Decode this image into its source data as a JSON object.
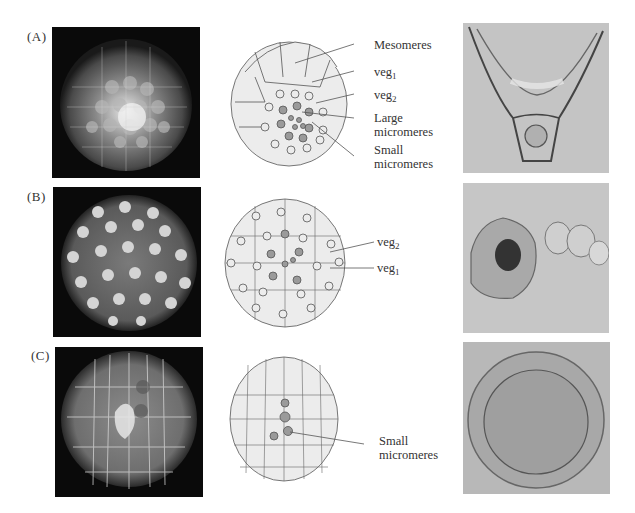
{
  "figure": {
    "panels": [
      {
        "id": "A",
        "label": "(A)",
        "fluorescence_image": "embryo-fluorescence-A",
        "diagram_labels": [
          {
            "text": "Mesomeres",
            "sub": ""
          },
          {
            "text": "veg",
            "sub": "1"
          },
          {
            "text": "veg",
            "sub": "2"
          },
          {
            "text": "Large",
            "sub": ""
          },
          {
            "text": "micromeres",
            "sub": ""
          },
          {
            "text": "Small",
            "sub": ""
          },
          {
            "text": "micromeres",
            "sub": ""
          }
        ],
        "larva_image": "pluteus-larva"
      },
      {
        "id": "B",
        "label": "(B)",
        "fluorescence_image": "embryo-fluorescence-B",
        "diagram_labels": [
          {
            "text": "veg",
            "sub": "2"
          },
          {
            "text": "veg",
            "sub": "1"
          }
        ],
        "larva_image": "abnormal-larva"
      },
      {
        "id": "C",
        "label": "(C)",
        "fluorescence_image": "embryo-fluorescence-C",
        "diagram_labels": [
          {
            "text": "Small",
            "sub": ""
          },
          {
            "text": "micromeres",
            "sub": ""
          }
        ],
        "larva_image": "blastula-sphere"
      }
    ]
  },
  "colors": {
    "cell_fill": "#ececec",
    "cell_stroke": "#555555",
    "micromere_fill": "#9a9a9a",
    "photo_bg": "#0a0a0a",
    "micro_bg": "#bdbdbd"
  }
}
